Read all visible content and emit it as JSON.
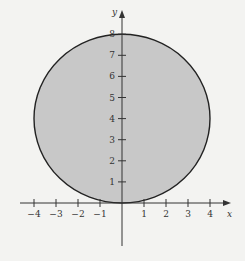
{
  "chart_data": {
    "type": "area",
    "title": "",
    "shape": {
      "kind": "circle",
      "center": [
        0,
        4
      ],
      "radius": 4,
      "fill": "#c8c8c8",
      "stroke": "#222222"
    },
    "xlabel": "x",
    "ylabel": "y",
    "x_ticks": [
      -4,
      -3,
      -2,
      -1,
      1,
      2,
      3,
      4
    ],
    "y_ticks": [
      1,
      2,
      3,
      4,
      5,
      6,
      7,
      8
    ],
    "x_tick_labels": [
      "−4",
      "−3",
      "−2",
      "−1",
      "1",
      "2",
      "3",
      "4"
    ],
    "y_tick_labels": [
      "1",
      "2",
      "3",
      "4",
      "5",
      "6",
      "7",
      "8"
    ],
    "xlim": [
      -4.5,
      5
    ],
    "ylim": [
      -2,
      8.5
    ],
    "grid": false,
    "legend": null
  },
  "axes": {
    "x_label": "x",
    "y_label": "y"
  }
}
